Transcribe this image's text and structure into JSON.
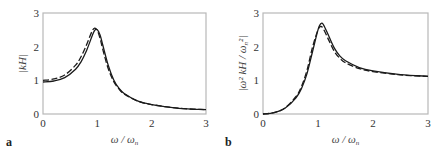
{
  "chart_data": [
    {
      "type": "line",
      "panel_label": "a",
      "title": "",
      "xlabel": "ω / ω_n",
      "ylabel": "|kH|",
      "xlim": [
        0,
        3
      ],
      "ylim": [
        0,
        3
      ],
      "xticks": [
        "0",
        "1",
        "2",
        "3"
      ],
      "yticks": [
        "0",
        "1",
        "2",
        "3"
      ],
      "grid": false,
      "legend": null,
      "x": [
        0,
        0.2,
        0.4,
        0.6,
        0.7,
        0.8,
        0.9,
        0.95,
        1.0,
        1.05,
        1.1,
        1.2,
        1.3,
        1.4,
        1.5,
        1.75,
        2.0,
        2.5,
        3.0
      ],
      "series": [
        {
          "name": "solid",
          "style": "solid",
          "values": [
            0.95,
            0.98,
            1.08,
            1.33,
            1.55,
            1.88,
            2.3,
            2.48,
            2.5,
            2.35,
            2.05,
            1.45,
            1.02,
            0.76,
            0.6,
            0.38,
            0.28,
            0.17,
            0.13
          ]
        },
        {
          "name": "dashed",
          "style": "dashed",
          "values": [
            1.0,
            1.04,
            1.16,
            1.45,
            1.7,
            2.05,
            2.45,
            2.55,
            2.48,
            2.25,
            1.92,
            1.35,
            0.97,
            0.74,
            0.59,
            0.38,
            0.28,
            0.17,
            0.13
          ]
        }
      ]
    },
    {
      "type": "line",
      "panel_label": "b",
      "title": "",
      "xlabel": "ω / ω_n",
      "ylabel": "|ω² kH / ω_n²|",
      "xlim": [
        0,
        3
      ],
      "ylim": [
        0,
        3
      ],
      "xticks": [
        "0",
        "1",
        "2",
        "3"
      ],
      "yticks": [
        "0",
        "1",
        "2",
        "3"
      ],
      "grid": false,
      "legend": null,
      "x": [
        0,
        0.2,
        0.4,
        0.6,
        0.7,
        0.8,
        0.9,
        1.0,
        1.05,
        1.1,
        1.2,
        1.3,
        1.4,
        1.5,
        1.75,
        2.0,
        2.5,
        3.0
      ],
      "series": [
        {
          "name": "solid",
          "style": "solid",
          "values": [
            0,
            0.04,
            0.17,
            0.48,
            0.76,
            1.2,
            1.85,
            2.5,
            2.68,
            2.65,
            2.3,
            1.95,
            1.72,
            1.58,
            1.38,
            1.28,
            1.17,
            1.12
          ]
        },
        {
          "name": "dashed",
          "style": "dashed",
          "values": [
            0,
            0.04,
            0.18,
            0.52,
            0.82,
            1.3,
            1.98,
            2.5,
            2.6,
            2.52,
            2.18,
            1.85,
            1.65,
            1.52,
            1.35,
            1.26,
            1.16,
            1.12
          ]
        }
      ]
    }
  ],
  "panels": {
    "a": {
      "letter": "a",
      "ylabel": "|kH|",
      "xlabel_main": "ω / ω",
      "xlabel_sub": "n"
    },
    "b": {
      "letter": "b",
      "ylabel_main": "|ω² kH / ω",
      "ylabel_sub": "n",
      "ylabel_end": "²|",
      "xlabel_main": "ω / ω",
      "xlabel_sub": "n"
    }
  },
  "colors": {
    "axis": "#b8b8b8",
    "curve": "#1a1a1a",
    "text": "#333333"
  }
}
